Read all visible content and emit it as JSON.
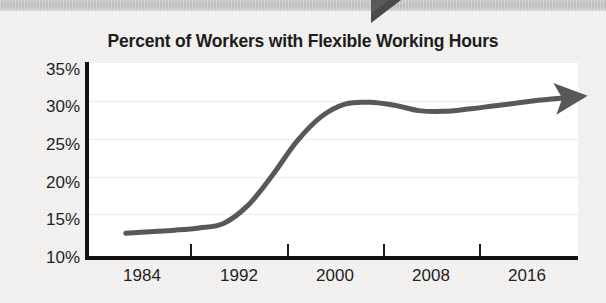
{
  "chart_data": {
    "type": "line",
    "title": "Percent of Workers with Flexible Working Hours",
    "xlabel": "",
    "ylabel": "",
    "xlim": [
      1980,
      2020
    ],
    "ylim": [
      10,
      35
    ],
    "grid": true,
    "legend": null,
    "y_ticks": [
      "35%",
      "30%",
      "25%",
      "20%",
      "15%",
      "10%"
    ],
    "y_tick_values": [
      35,
      30,
      25,
      20,
      15,
      10
    ],
    "x_ticks": [
      "1984",
      "1992",
      "2000",
      "2008",
      "2016"
    ],
    "x_tick_values": [
      1984,
      1992,
      2000,
      2008,
      2016
    ],
    "series": [
      {
        "name": "Percent of workers with flexible working hours",
        "x": [
          1983,
          1985,
          1987,
          1989,
          1991,
          1993,
          1995,
          1997,
          1999,
          2001,
          2003,
          2005,
          2007,
          2009,
          2011,
          2013,
          2015,
          2017,
          2019
        ],
        "values": [
          13.3,
          13.5,
          13.7,
          14.0,
          14.6,
          17.0,
          21.0,
          25.5,
          28.8,
          30.5,
          30.7,
          30.3,
          29.6,
          29.5,
          29.8,
          30.2,
          30.6,
          31.0,
          31.3
        ],
        "color": "#585858",
        "arrow_end": true,
        "style": "smooth-line"
      }
    ],
    "annotations": [],
    "colors": {
      "line": "#585858",
      "axis": "#111111",
      "grid": "#ececec",
      "plot_background": "#ffffff",
      "page_background": "#f3f2f0",
      "title_text": "#1d1d1d",
      "tick_text": "#1f1f1f",
      "top_band": "#c3c2c0",
      "notch": "#4a4a4a"
    }
  },
  "page": {
    "top_band_label": "page-top-band",
    "notch_label": "page-notch-marker"
  }
}
